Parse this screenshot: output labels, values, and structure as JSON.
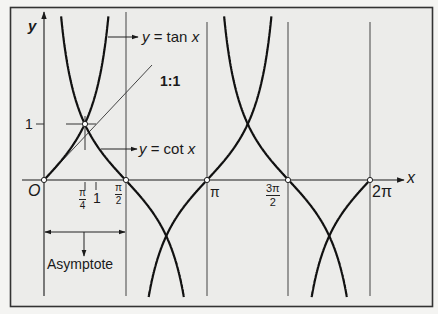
{
  "chart_data": {
    "type": "line",
    "title": "",
    "xlabel": "x",
    "ylabel": "y",
    "series": [
      {
        "name": "y = tan x",
        "function": "tan(x)"
      },
      {
        "name": "y = cot x",
        "function": "cot(x)"
      }
    ],
    "x_range": [
      0,
      6.2832
    ],
    "ylim": [
      -2.1,
      2.95
    ],
    "x_ticks": [
      {
        "value": 0,
        "label": "O"
      },
      {
        "value": 0.7854,
        "label": "π/4"
      },
      {
        "value": 1,
        "label": "1"
      },
      {
        "value": 1.5708,
        "label": "π/2"
      },
      {
        "value": 3.1416,
        "label": "π"
      },
      {
        "value": 4.7124,
        "label": "3π/2"
      },
      {
        "value": 6.2832,
        "label": "2π"
      }
    ],
    "y_ticks": [
      {
        "value": 1,
        "label": "1"
      }
    ],
    "asymptotes_x": [
      1.5708,
      3.1416,
      4.7124,
      6.2832
    ],
    "reference_line": {
      "label": "1:1",
      "slope": 1,
      "from": [
        0,
        0
      ],
      "to": [
        2.08,
        2.08
      ]
    },
    "annotations": [
      {
        "text": "y = tan x",
        "target": "tan curve"
      },
      {
        "text": "y = cot x",
        "target": "cot curve"
      },
      {
        "text": "1:1",
        "target": "slope line at origin"
      },
      {
        "text": "Asymptote",
        "target": "interval 0 to π/2"
      }
    ],
    "marked_points": [
      [
        0,
        0
      ],
      [
        0.7854,
        1
      ],
      [
        1.5708,
        0
      ],
      [
        3.1416,
        0
      ],
      [
        4.7124,
        0
      ],
      [
        6.2832,
        0
      ]
    ],
    "grid": false,
    "legend": "none"
  },
  "labels": {
    "y_axis": "y",
    "x_axis": "x",
    "origin": "O",
    "y_one": "1",
    "x_one": "1",
    "pi": "π",
    "four": "4",
    "two": "2",
    "three_pi": "3π",
    "two_pi": "2π",
    "tan_label_y": "y",
    "tan_label_eq": "= tan",
    "tan_label_x": "x",
    "cot_label_y": "y",
    "cot_label_eq": "= cot",
    "cot_label_x": "x",
    "ratio": "1:1",
    "asymptote": "Asymptote"
  },
  "colors": {
    "background": "#f4f4f2",
    "ink": "#1a1a1a",
    "frame": "#333333"
  }
}
